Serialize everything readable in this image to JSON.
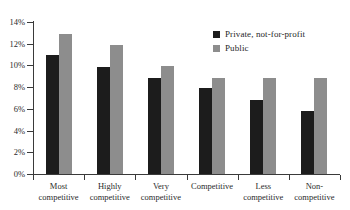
{
  "chart_data": {
    "type": "bar",
    "title": "",
    "subtitle": "",
    "xlabel": "",
    "ylabel": "",
    "grid": false,
    "legend_position": "top-right",
    "categories": [
      "Most\ncompetitive",
      "Highly\ncompetitive",
      "Very\ncompetitive",
      "Competitive",
      "Less\ncompetitive",
      "Non-\ncompetitive"
    ],
    "series": [
      {
        "name": "Private, not-for-profit",
        "color": "#1c1c1c",
        "values": [
          11.0,
          9.9,
          8.85,
          7.9,
          6.8,
          5.85
        ]
      },
      {
        "name": "Public",
        "color": "#8d8d8d",
        "values": [
          12.9,
          11.85,
          9.95,
          8.85,
          8.8,
          8.8
        ]
      }
    ],
    "ylim": [
      0,
      14
    ],
    "ytick_values": [
      0,
      2,
      4,
      6,
      8,
      10,
      12,
      14
    ],
    "ytick_labels": [
      "0%",
      "2%",
      "4%",
      "6%",
      "8%",
      "10%",
      "12%",
      "14%"
    ]
  },
  "legend": {
    "items": [
      {
        "label": "Private, not-for-profit",
        "swatch": "#1c1c1c"
      },
      {
        "label": "Public",
        "swatch": "#8d8d8d"
      }
    ]
  }
}
